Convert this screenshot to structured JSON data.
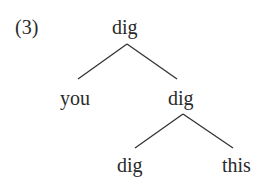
{
  "example_number": "(3)",
  "tree": {
    "root": {
      "label": "dig"
    },
    "level1": [
      {
        "label": "you"
      },
      {
        "label": "dig"
      }
    ],
    "level2": [
      {
        "label": "dig"
      },
      {
        "label": "this"
      }
    ]
  },
  "edges": [
    {
      "from": "root",
      "to": "level1.0"
    },
    {
      "from": "root",
      "to": "level1.1"
    },
    {
      "from": "level1.1",
      "to": "level2.0"
    },
    {
      "from": "level1.1",
      "to": "level2.1"
    }
  ],
  "colors": {
    "text": "#2a2a2a",
    "line": "#333333"
  }
}
